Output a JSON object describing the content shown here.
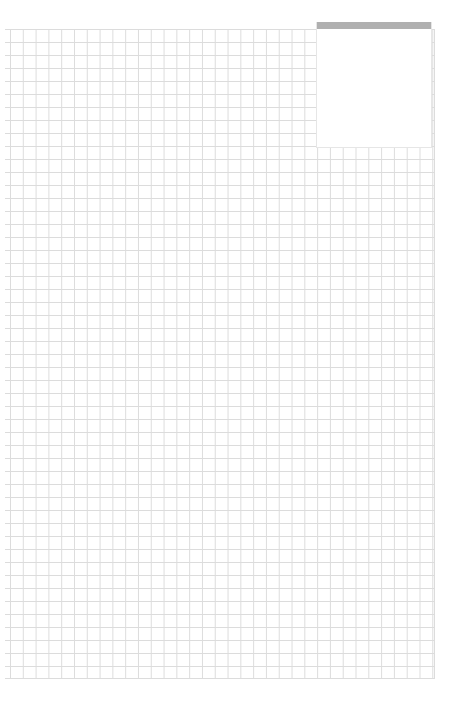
{
  "document": {
    "type": "graph-paper",
    "grid": {
      "line_color": "#dcdcdc",
      "background": "#ffffff"
    }
  },
  "panel": {
    "header_color": "#b0b0b0",
    "body_color": "#ffffff",
    "title": "",
    "content": ""
  }
}
